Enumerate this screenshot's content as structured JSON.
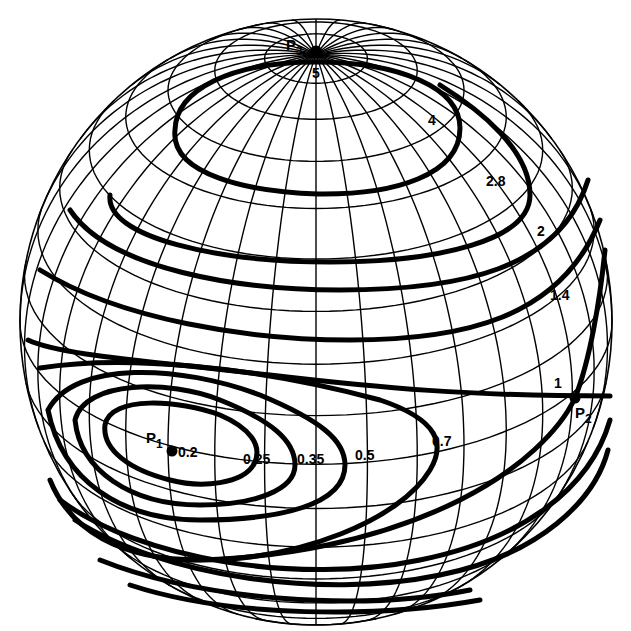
{
  "figure": {
    "background": "#ffffff",
    "ink": "#000000"
  },
  "points": [
    {
      "id": "P1",
      "label": "P",
      "subscript": "1",
      "x": 172,
      "y": 451
    },
    {
      "id": "P2",
      "label": "P",
      "subscript": "2",
      "x": 575,
      "y": 398
    },
    {
      "id": "P3",
      "label": "P",
      "subscript": "3",
      "x": 316,
      "y": 52
    }
  ],
  "contour_labels": [
    {
      "value": "0.2",
      "x": 178,
      "y": 457
    },
    {
      "value": "0.25",
      "x": 243,
      "y": 464
    },
    {
      "value": "0.35",
      "x": 297,
      "y": 464
    },
    {
      "value": "0.5",
      "x": 355,
      "y": 460
    },
    {
      "value": "0.7",
      "x": 432,
      "y": 446
    },
    {
      "value": "1",
      "x": 554,
      "y": 388
    },
    {
      "value": "1.4",
      "x": 550,
      "y": 300
    },
    {
      "value": "2",
      "x": 537,
      "y": 236
    },
    {
      "value": "2.8",
      "x": 486,
      "y": 186
    },
    {
      "value": "4",
      "x": 428,
      "y": 125
    },
    {
      "value": "5",
      "x": 312,
      "y": 78
    }
  ],
  "contours": [
    {
      "value": "5",
      "d": "M316,52 m-4,0 a4,4 0 1,0 8,0 a4,4 0 1,0 -8,0"
    },
    {
      "value": "4",
      "d": "M175,130 C170,175 250,192 318,194 C395,195 460,175 460,128 C460,88 400,62 316,62 C230,62 176,90 175,130"
    },
    {
      "value": "2.8",
      "d": "M110,195 C105,238 220,262 330,262 C440,262 530,240 530,195 C530,150 480,110 440,85"
    },
    {
      "value": "2",
      "d": "M70,210 C110,270 240,290 340,290 C460,290 560,270 588,180"
    },
    {
      "value": "1.4",
      "d": "M40,270 C120,320 250,340 350,340 C460,340 560,320 600,220"
    },
    {
      "value": "1",
      "d": "M28,340 C60,355 140,360 270,375 C380,388 470,396 610,396"
    },
    {
      "value": "0.7",
      "d": "M40,368 C120,355 250,365 380,400 C440,420 445,445 430,470 C400,520 300,560 200,560 C120,560 70,530 50,480"
    },
    {
      "value": "0.5",
      "d": "M48,410 C75,360 180,365 260,395 C320,420 345,440 345,465 C345,505 280,520 200,520 C120,520 62,480 48,410"
    },
    {
      "value": "0.35",
      "d": "M75,420 C85,380 170,380 220,400 C270,420 295,440 295,465 C295,490 255,505 200,505 C130,505 80,470 75,420"
    },
    {
      "value": "0.25",
      "d": "M105,425 C110,395 180,400 220,415 C250,428 262,445 255,462 C245,485 200,488 170,480 C130,470 102,450 105,425"
    },
    {
      "value": "P2-a",
      "d": "M575,398 C560,430 520,470 460,500 C380,540 280,560 180,560"
    },
    {
      "value": "P2-b",
      "d": "M575,398 C590,360 600,300 605,250"
    },
    {
      "value": "outer-1",
      "d": "M60,500 C140,560 300,585 420,560 C520,540 590,490 610,420"
    },
    {
      "value": "outer-2",
      "d": "M75,520 C160,575 320,600 440,575 C540,555 595,500 608,450"
    },
    {
      "value": "outer-3",
      "d": "M100,560 C200,600 360,612 470,590"
    },
    {
      "value": "outer-4",
      "d": "M130,585 C230,618 380,618 480,600"
    }
  ],
  "sphere": {
    "cx": 316,
    "cy": 322,
    "rx": 296,
    "ry": 303,
    "tilt_deg": 28,
    "meridians": 36,
    "parallels": [
      80,
      70,
      60,
      50,
      40,
      30,
      20,
      10,
      0,
      -10,
      -20,
      -30,
      -40,
      -50,
      -60,
      -70
    ]
  }
}
